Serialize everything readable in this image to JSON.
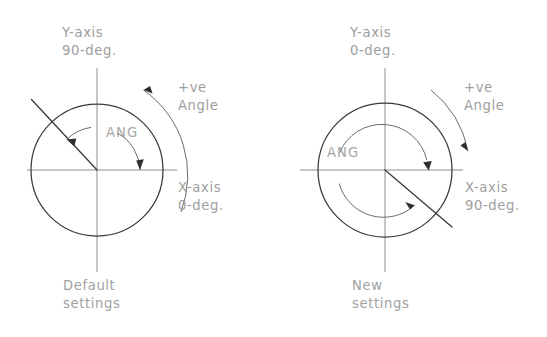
{
  "figure": {
    "background_color": "#ffffff",
    "line_color": "#3a3a3a",
    "axis_color": "#8d8d8d",
    "text_color": "#9e9e9e",
    "arrow_color": "#2e2e2e"
  },
  "panels": [
    {
      "id": "default",
      "caption_line1": "Default",
      "caption_line2": "settings",
      "y_axis_label_line1": "Y-axis",
      "y_axis_label_line2": "90-deg.",
      "x_axis_label_line1": "X-axis",
      "x_axis_label_line2": "0-deg.",
      "positive_label_line1": "+ve",
      "positive_label_line2": "Angle",
      "angle_label": "ANG",
      "zero_direction": "east",
      "positive_rotation": "counter-clockwise",
      "angle_start_deg": 0,
      "angle_end_deg": 135,
      "circle_center_x": 97,
      "circle_center_y": 170,
      "circle_radius": 66,
      "angle_arc_radius": 43,
      "positive_arc_radius": 102
    },
    {
      "id": "new",
      "caption_line1": "New",
      "caption_line2": "settings",
      "y_axis_label_line1": "Y-axis",
      "y_axis_label_line2": "0-deg.",
      "x_axis_label_line1": "X-axis",
      "x_axis_label_line2": "90-deg.",
      "positive_label_line1": "+ve",
      "positive_label_line2": "Angle",
      "angle_label": "ANG",
      "zero_direction": "north",
      "positive_rotation": "clockwise",
      "angle_start_deg": 0,
      "angle_end_deg": 140,
      "circle_center_x": 385,
      "circle_center_y": 170,
      "circle_radius": 67,
      "angle_arc_radius": 46,
      "positive_arc_radius": 100
    }
  ]
}
